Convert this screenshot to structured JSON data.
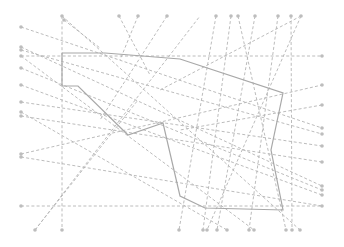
{
  "diagram": {
    "type": "routing-diagram",
    "width": 344,
    "height": 247,
    "colors": {
      "connection": "#b4b4b4",
      "pin": "#bdbdbd",
      "route": "#a8a8a8",
      "background": "#ffffff"
    },
    "pins": {
      "top": [
        [
          62,
          16
        ],
        [
          64,
          20
        ],
        [
          119,
          16
        ],
        [
          138,
          16
        ],
        [
          167,
          16
        ],
        [
          216,
          16
        ],
        [
          231,
          16
        ],
        [
          238,
          16
        ],
        [
          255,
          16
        ],
        [
          278,
          16
        ],
        [
          291,
          16
        ],
        [
          301,
          16
        ]
      ],
      "bottom": [
        [
          35,
          230
        ],
        [
          62,
          230
        ],
        [
          179,
          230
        ],
        [
          203,
          230
        ],
        [
          207,
          230
        ],
        [
          217,
          230
        ],
        [
          227,
          230
        ],
        [
          249,
          230
        ],
        [
          254,
          230
        ],
        [
          286,
          230
        ],
        [
          292,
          230
        ],
        [
          300,
          230
        ]
      ],
      "left": [
        [
          21,
          27
        ],
        [
          21,
          47
        ],
        [
          21,
          50
        ],
        [
          21,
          56
        ],
        [
          21,
          68
        ],
        [
          21,
          85
        ],
        [
          21,
          102
        ],
        [
          21,
          112
        ],
        [
          21,
          116
        ],
        [
          21,
          154
        ],
        [
          21,
          157
        ],
        [
          21,
          206
        ]
      ],
      "right": [
        [
          322,
          56
        ],
        [
          322,
          85
        ],
        [
          322,
          105
        ],
        [
          322,
          128
        ],
        [
          322,
          134
        ],
        [
          322,
          146
        ],
        [
          322,
          162
        ],
        [
          322,
          186
        ],
        [
          322,
          190
        ],
        [
          322,
          195
        ],
        [
          322,
          206
        ]
      ]
    },
    "connections": [
      [
        62,
        16,
        62,
        230
      ],
      [
        64,
        20,
        100,
        48
      ],
      [
        119,
        16,
        150,
        75
      ],
      [
        138,
        16,
        120,
        60
      ],
      [
        167,
        16,
        100,
        120
      ],
      [
        216,
        16,
        179,
        230
      ],
      [
        231,
        16,
        203,
        230
      ],
      [
        238,
        16,
        286,
        230
      ],
      [
        255,
        16,
        217,
        230
      ],
      [
        278,
        16,
        249,
        230
      ],
      [
        291,
        16,
        292,
        230
      ],
      [
        301,
        16,
        160,
        90
      ],
      [
        21,
        27,
        322,
        128
      ],
      [
        21,
        47,
        322,
        186
      ],
      [
        21,
        50,
        322,
        134
      ],
      [
        21,
        56,
        322,
        56
      ],
      [
        21,
        68,
        322,
        190
      ],
      [
        21,
        85,
        322,
        195
      ],
      [
        21,
        102,
        322,
        146
      ],
      [
        21,
        112,
        227,
        230
      ],
      [
        21,
        116,
        322,
        162
      ],
      [
        21,
        154,
        322,
        85
      ],
      [
        21,
        157,
        322,
        206
      ],
      [
        21,
        206,
        322,
        206
      ],
      [
        35,
        230,
        200,
        16
      ],
      [
        62,
        16,
        300,
        230
      ],
      [
        21,
        56,
        254,
        230
      ],
      [
        301,
        16,
        207,
        230
      ],
      [
        322,
        105,
        180,
        130
      ],
      [
        35,
        230,
        138,
        100
      ]
    ],
    "route": [
      [
        62,
        53
      ],
      [
        105,
        53
      ],
      [
        180,
        59
      ],
      [
        283,
        93
      ],
      [
        271,
        150
      ],
      [
        283,
        210
      ],
      [
        205,
        208
      ],
      [
        180,
        196
      ],
      [
        163,
        123
      ],
      [
        128,
        135
      ],
      [
        78,
        86
      ],
      [
        62,
        86
      ],
      [
        62,
        53
      ]
    ]
  }
}
